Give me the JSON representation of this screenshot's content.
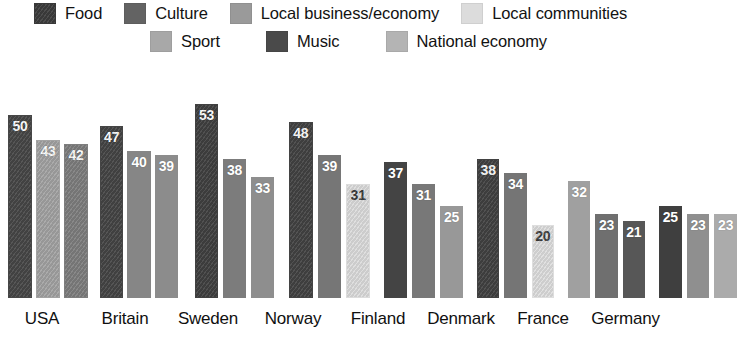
{
  "legend": {
    "rows": [
      {
        "items": [
          {
            "label": "Food",
            "color": "#3d3d3d",
            "hatched": true
          },
          {
            "label": "Culture",
            "color": "#636363",
            "hatched": false
          },
          {
            "label": "Local business/economy",
            "color": "#9a9a9a",
            "hatched": false
          },
          {
            "label": "Local communities",
            "color": "#dcdcdc",
            "hatched": false
          }
        ]
      },
      {
        "items": [
          {
            "label": "Sport",
            "color": "#a8a8a8",
            "hatched": false
          },
          {
            "label": "Music",
            "color": "#4a4a4a",
            "hatched": false
          },
          {
            "label": "National economy",
            "color": "#b4b4b4",
            "hatched": false
          }
        ]
      }
    ]
  },
  "chart_data": {
    "type": "bar",
    "title": "",
    "subtitle": "",
    "xlabel": "",
    "ylabel": "",
    "ylim": [
      0,
      60
    ],
    "grid": false,
    "legend_position": "top",
    "categories": [
      "USA",
      "Britain",
      "Sweden",
      "Norway",
      "Finland",
      "Denmark",
      "France",
      "Germany"
    ],
    "series": [
      {
        "name": "Food",
        "values": [
          50,
          47,
          53,
          48,
          37,
          38,
          32,
          25
        ]
      },
      {
        "name": "Culture",
        "values": [
          43,
          40,
          38,
          39,
          31,
          34,
          23,
          23
        ]
      },
      {
        "name": "Local business/economy",
        "values": [
          42,
          39,
          33,
          31,
          25,
          20,
          21,
          23
        ]
      }
    ],
    "groups": [
      {
        "category": "USA",
        "bars": [
          {
            "value": 50,
            "color": "#474747",
            "hatched": true,
            "label_color": "light"
          },
          {
            "value": 43,
            "color": "#a3a3a3",
            "hatched": true,
            "label_color": "light"
          },
          {
            "value": 42,
            "color": "#7e7e7e",
            "hatched": true,
            "label_color": "light"
          }
        ]
      },
      {
        "category": "Britain",
        "bars": [
          {
            "value": 47,
            "color": "#454545",
            "hatched": true,
            "label_color": "light"
          },
          {
            "value": 40,
            "color": "#868686",
            "hatched": false,
            "label_color": "light"
          },
          {
            "value": 39,
            "color": "#8c8c8c",
            "hatched": false,
            "label_color": "light"
          }
        ]
      },
      {
        "category": "Sweden",
        "bars": [
          {
            "value": 53,
            "color": "#414141",
            "hatched": true,
            "label_color": "light"
          },
          {
            "value": 38,
            "color": "#7c7c7c",
            "hatched": false,
            "label_color": "light"
          },
          {
            "value": 33,
            "color": "#8e8e8e",
            "hatched": false,
            "label_color": "light"
          }
        ]
      },
      {
        "category": "Norway",
        "bars": [
          {
            "value": 48,
            "color": "#434343",
            "hatched": true,
            "label_color": "light"
          },
          {
            "value": 39,
            "color": "#767676",
            "hatched": false,
            "label_color": "light"
          },
          {
            "value": 31,
            "color": "#dcdcdc",
            "hatched": true,
            "label_color": "dark"
          }
        ]
      },
      {
        "category": "Finland",
        "bars": [
          {
            "value": 37,
            "color": "#444444",
            "hatched": false,
            "label_color": "light"
          },
          {
            "value": 31,
            "color": "#787878",
            "hatched": false,
            "label_color": "light"
          },
          {
            "value": 25,
            "color": "#989898",
            "hatched": false,
            "label_color": "light"
          }
        ]
      },
      {
        "category": "Denmark",
        "bars": [
          {
            "value": 38,
            "color": "#424242",
            "hatched": true,
            "label_color": "light"
          },
          {
            "value": 34,
            "color": "#757575",
            "hatched": false,
            "label_color": "light"
          },
          {
            "value": 20,
            "color": "#dedede",
            "hatched": true,
            "label_color": "dark"
          }
        ]
      },
      {
        "category": "France",
        "bars": [
          {
            "value": 32,
            "color": "#a0a0a0",
            "hatched": false,
            "label_color": "light"
          },
          {
            "value": 23,
            "color": "#6f6f6f",
            "hatched": false,
            "label_color": "light"
          },
          {
            "value": 21,
            "color": "#575757",
            "hatched": false,
            "label_color": "light"
          }
        ]
      },
      {
        "category": "Germany",
        "bars": [
          {
            "value": 25,
            "color": "#3f3f3f",
            "hatched": false,
            "label_color": "light"
          },
          {
            "value": 23,
            "color": "#8f8f8f",
            "hatched": false,
            "label_color": "light"
          },
          {
            "value": 23,
            "color": "#ababab",
            "hatched": false,
            "label_color": "light"
          }
        ]
      }
    ]
  }
}
